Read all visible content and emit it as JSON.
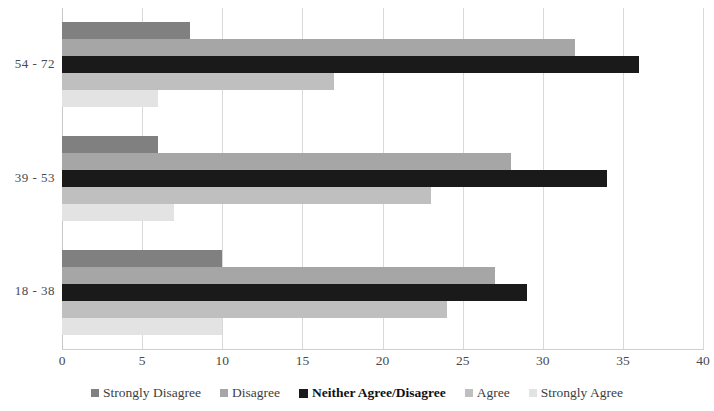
{
  "chart_data": {
    "type": "bar",
    "orientation": "horizontal",
    "title": "",
    "subtitle": "",
    "xlabel": "",
    "ylabel": "",
    "categories": [
      "18 - 38",
      "39 - 53",
      "54 - 72"
    ],
    "series": [
      {
        "name": "Strongly Disagree",
        "color": "#808080",
        "values": [
          10,
          6,
          8
        ]
      },
      {
        "name": "Disagree",
        "color": "#a6a6a6",
        "values": [
          27,
          28,
          32
        ]
      },
      {
        "name": "Neither Agree/Disagree",
        "color": "#1a1a1a",
        "values": [
          29,
          34,
          36
        ]
      },
      {
        "name": "Agree",
        "color": "#bfbfbf",
        "values": [
          24,
          23,
          17
        ]
      },
      {
        "name": "Strongly Agree",
        "color": "#e3e3e3",
        "values": [
          10,
          7,
          6
        ]
      }
    ],
    "xticks": [
      "0",
      "5",
      "10",
      "15",
      "20",
      "25",
      "30",
      "35",
      "40"
    ],
    "xtick_values": [
      0,
      5,
      10,
      15,
      20,
      25,
      30,
      35,
      40
    ],
    "xlim": [
      0,
      40
    ],
    "grid": "vertical",
    "legend_position": "bottom",
    "legend_emphasis": "Neither Agree/Disagree",
    "background_color": "#ffffff",
    "gridline_color": "#d9d9d9"
  }
}
